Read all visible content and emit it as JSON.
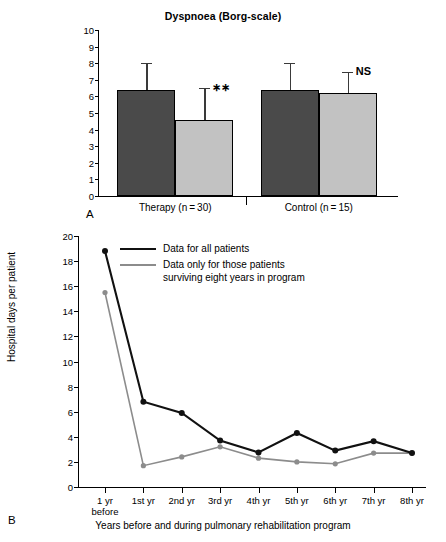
{
  "panelA": {
    "label": "A",
    "title": "Dyspnoea (Borg-scale)",
    "groups": [
      {
        "name": "Therapy (n = 30)",
        "sig": "∗∗"
      },
      {
        "name": "Control (n = 15)",
        "sig": "NS"
      }
    ]
  },
  "panelB": {
    "label": "B",
    "legend": [
      {
        "text": "Data for all patients",
        "color": "#111111"
      },
      {
        "text": "Data only for those patients",
        "text2": "surviving eight years in program",
        "color": "#8c8c8c"
      }
    ]
  },
  "chart_data": [
    {
      "type": "bar",
      "panel": "A",
      "title": "Dyspnoea (Borg-scale)",
      "xlabel": "",
      "ylabel": "",
      "ylim": [
        0,
        10
      ],
      "yticks": [
        0,
        1,
        2,
        3,
        4,
        5,
        6,
        7,
        8,
        9,
        10
      ],
      "grid": false,
      "legend_position": "none",
      "categories": [
        "Therapy (n = 30)",
        "Control (n = 15)"
      ],
      "series": [
        {
          "name": "Before",
          "color": "#4a4a4a",
          "values": [
            6.4,
            6.4
          ],
          "errors_upper": [
            8.0,
            8.0
          ]
        },
        {
          "name": "After",
          "color": "#c2c2c2",
          "values": [
            4.6,
            6.2
          ],
          "errors_upper": [
            6.5,
            7.5
          ]
        }
      ],
      "annotations": [
        {
          "text": "∗∗",
          "category": "Therapy (n = 30)",
          "series": "After"
        },
        {
          "text": "NS",
          "category": "Control (n = 15)",
          "series": "After"
        }
      ]
    },
    {
      "type": "line",
      "panel": "B",
      "title": "",
      "xlabel": "Years before and during pulmonary rehabilitation program",
      "ylabel": "Hospital days per patient",
      "ylim": [
        0,
        20
      ],
      "yticks": [
        0,
        2,
        4,
        6,
        8,
        10,
        12,
        14,
        16,
        18,
        20
      ],
      "grid": false,
      "legend_position": "upper-left",
      "categories": [
        "1 yr before",
        "1st yr",
        "2nd yr",
        "3rd yr",
        "4th yr",
        "5th yr",
        "6th yr",
        "7th yr",
        "8th yr"
      ],
      "series": [
        {
          "name": "Data for all patients",
          "color": "#111111",
          "values": [
            18.8,
            6.8,
            5.9,
            3.7,
            2.75,
            4.3,
            2.9,
            3.65,
            2.7
          ]
        },
        {
          "name": "Data only for those patients surviving eight years in program",
          "color": "#8c8c8c",
          "values": [
            15.5,
            1.7,
            2.4,
            3.2,
            2.3,
            2.0,
            1.85,
            2.7,
            2.7
          ]
        }
      ]
    }
  ]
}
